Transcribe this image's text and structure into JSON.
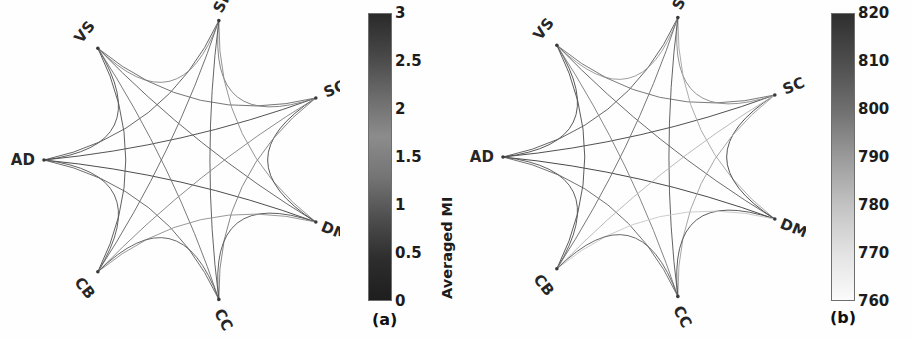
{
  "figure": {
    "width": 912,
    "height": 339,
    "background": "#fefefe"
  },
  "chart_data": [
    {
      "type": "graph",
      "panel": "a",
      "caption": "(a)",
      "title": "",
      "nodes": [
        "AD",
        "VS",
        "SM",
        "SC",
        "DM",
        "CC",
        "CB"
      ],
      "node_label_rotations": [
        0,
        -52,
        -62,
        -22,
        22,
        62,
        52
      ],
      "node_angles_deg": [
        180,
        231.43,
        282.86,
        334.29,
        25.71,
        77.14,
        128.57
      ],
      "colorbar": {
        "label": "Averaged MI",
        "ticks": [
          "3",
          "2.5",
          "2",
          "1.5",
          "1",
          "0.5",
          "0"
        ],
        "tick_values": [
          3,
          2.5,
          2,
          1.5,
          1,
          0.5,
          0
        ],
        "vmin": 0,
        "vmax": 3,
        "orientation": "vertical",
        "stops": [
          "#2a2a2a",
          "#474747",
          "#6b6b6b",
          "#8c8c8c",
          "#747474",
          "#4e4e4e",
          "#2d2d2d",
          "#1e1e1e"
        ]
      },
      "edges": [
        {
          "source": "AD",
          "target": "VS",
          "value": 1.95,
          "shade": "#555555"
        },
        {
          "source": "AD",
          "target": "SM",
          "value": 1.7,
          "shade": "#5e5e5e"
        },
        {
          "source": "AD",
          "target": "SC",
          "value": 2.1,
          "shade": "#4a4a4a"
        },
        {
          "source": "AD",
          "target": "DM",
          "value": 2.35,
          "shade": "#434343"
        },
        {
          "source": "AD",
          "target": "CC",
          "value": 1.55,
          "shade": "#666666"
        },
        {
          "source": "AD",
          "target": "CB",
          "value": 1.8,
          "shade": "#5a5a5a"
        },
        {
          "source": "VS",
          "target": "SM",
          "value": 1.1,
          "shade": "#8a8a8a"
        },
        {
          "source": "VS",
          "target": "SC",
          "value": 1.45,
          "shade": "#6e6e6e"
        },
        {
          "source": "VS",
          "target": "DM",
          "value": 1.6,
          "shade": "#636363"
        },
        {
          "source": "VS",
          "target": "CC",
          "value": 1.35,
          "shade": "#747474"
        },
        {
          "source": "VS",
          "target": "CB",
          "value": 1.9,
          "shade": "#575757"
        },
        {
          "source": "SM",
          "target": "SC",
          "value": 1.25,
          "shade": "#7d7d7d"
        },
        {
          "source": "SM",
          "target": "DM",
          "value": 1.05,
          "shade": "#8f8f8f"
        },
        {
          "source": "SM",
          "target": "CC",
          "value": 1.75,
          "shade": "#5c5c5c"
        },
        {
          "source": "SM",
          "target": "CB",
          "value": 1.5,
          "shade": "#6a6a6a"
        },
        {
          "source": "SC",
          "target": "DM",
          "value": 2.0,
          "shade": "#4f4f4f"
        },
        {
          "source": "SC",
          "target": "CC",
          "value": 1.2,
          "shade": "#828282"
        },
        {
          "source": "SC",
          "target": "CB",
          "value": 1.15,
          "shade": "#878787"
        },
        {
          "source": "DM",
          "target": "CC",
          "value": 1.85,
          "shade": "#585858"
        },
        {
          "source": "DM",
          "target": "CB",
          "value": 1.0,
          "shade": "#949494"
        },
        {
          "source": "CC",
          "target": "CB",
          "value": 1.65,
          "shade": "#606060"
        }
      ]
    },
    {
      "type": "graph",
      "panel": "b",
      "caption": "(b)",
      "title": "",
      "nodes": [
        "AD",
        "VS",
        "SM",
        "SC",
        "DM",
        "CC",
        "CB"
      ],
      "node_label_rotations": [
        0,
        -52,
        -62,
        -22,
        22,
        62,
        52
      ],
      "node_angles_deg": [
        180,
        231.43,
        282.86,
        334.29,
        25.71,
        77.14,
        128.57
      ],
      "colorbar": {
        "label": "No. of Significant Subjects",
        "ticks": [
          "820",
          "810",
          "800",
          "790",
          "780",
          "770",
          "760"
        ],
        "tick_values": [
          820,
          810,
          800,
          790,
          780,
          770,
          760
        ],
        "vmin": 755,
        "vmax": 824,
        "orientation": "vertical",
        "stops": [
          "#2f2f2f",
          "#4d4d4d",
          "#6f6f6f",
          "#9a9a9a",
          "#c2c2c2",
          "#e2e2e2",
          "#fbfbfb"
        ]
      },
      "edges": [
        {
          "source": "AD",
          "target": "VS",
          "value": 812,
          "shade": "#4f4f4f"
        },
        {
          "source": "AD",
          "target": "SM",
          "value": 806,
          "shade": "#5e5e5e"
        },
        {
          "source": "AD",
          "target": "SC",
          "value": 815,
          "shade": "#474747"
        },
        {
          "source": "AD",
          "target": "DM",
          "value": 818,
          "shade": "#3f3f3f"
        },
        {
          "source": "AD",
          "target": "CC",
          "value": 801,
          "shade": "#6b6b6b"
        },
        {
          "source": "AD",
          "target": "CB",
          "value": 809,
          "shade": "#575757"
        },
        {
          "source": "VS",
          "target": "SM",
          "value": 790,
          "shade": "#9a9a9a"
        },
        {
          "source": "VS",
          "target": "SC",
          "value": 798,
          "shade": "#737373"
        },
        {
          "source": "VS",
          "target": "DM",
          "value": 803,
          "shade": "#656565"
        },
        {
          "source": "VS",
          "target": "CC",
          "value": 795,
          "shade": "#808080"
        },
        {
          "source": "VS",
          "target": "CB",
          "value": 811,
          "shade": "#525252"
        },
        {
          "source": "SM",
          "target": "SC",
          "value": 793,
          "shade": "#8c8c8c"
        },
        {
          "source": "SM",
          "target": "DM",
          "value": 786,
          "shade": "#a8a8a8"
        },
        {
          "source": "SM",
          "target": "CC",
          "value": 807,
          "shade": "#5b5b5b"
        },
        {
          "source": "SM",
          "target": "CB",
          "value": 799,
          "shade": "#707070"
        },
        {
          "source": "SC",
          "target": "DM",
          "value": 814,
          "shade": "#4a4a4a"
        },
        {
          "source": "SC",
          "target": "CC",
          "value": 788,
          "shade": "#a1a1a1"
        },
        {
          "source": "SC",
          "target": "CB",
          "value": 782,
          "shade": "#b6b6b6"
        },
        {
          "source": "DM",
          "target": "CC",
          "value": 810,
          "shade": "#545454"
        },
        {
          "source": "DM",
          "target": "CB",
          "value": 775,
          "shade": "#c9c9c9"
        },
        {
          "source": "CC",
          "target": "CB",
          "value": 804,
          "shade": "#626262"
        }
      ]
    }
  ],
  "panels": {
    "a": {
      "caption": "(a)",
      "colorbar_label": "Averaged MI",
      "ticks": [
        "3",
        "2.5",
        "2",
        "1.5",
        "1",
        "0.5",
        "0"
      ]
    },
    "b": {
      "caption": "(b)",
      "colorbar_label": "No. of Significant Subjects",
      "ticks": [
        "820",
        "810",
        "800",
        "790",
        "780",
        "770",
        "760"
      ]
    }
  }
}
